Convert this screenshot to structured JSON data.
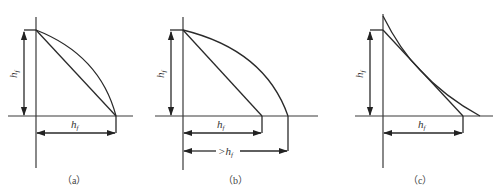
{
  "figure": {
    "panels": [
      {
        "caption": "（a）",
        "vertical_label": "h",
        "vertical_sub": "f",
        "horizontal_labels": [
          {
            "text": "h",
            "sub": "f"
          }
        ],
        "description": "Convex curve and straight line both end at the same horizontal distance h_f"
      },
      {
        "caption": "（b）",
        "vertical_label": "h",
        "vertical_sub": "f",
        "horizontal_labels": [
          {
            "text": "h",
            "sub": "f"
          },
          {
            "text": ">h",
            "sub": "f"
          }
        ],
        "description": "Convex curve extends beyond h_f; straight line ends at h_f"
      },
      {
        "caption": "（c）",
        "vertical_label": "h",
        "vertical_sub": "f",
        "horizontal_labels": [
          {
            "text": "h",
            "sub": "f"
          }
        ],
        "description": "Concave curve starts above h_f and extends beyond straight line end"
      }
    ]
  }
}
